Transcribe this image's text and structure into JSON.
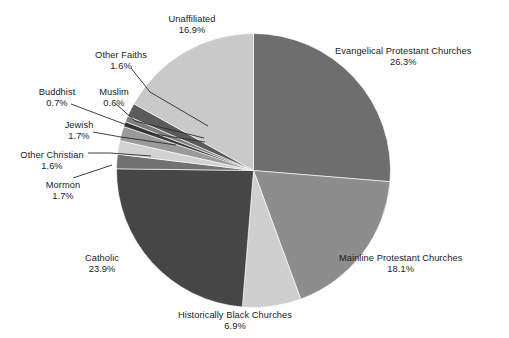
{
  "chart_data": {
    "type": "pie",
    "title": "",
    "subtitle": "",
    "xlabel": "",
    "ylabel": "",
    "grid": false,
    "legend_position": "none",
    "label_format": "name above percent, leader lines to thin slices",
    "start_angle_deg": 0,
    "direction": "clockwise",
    "units": "percent",
    "categories": [
      "Evangelical Protestant Churches",
      "Mainline Protestant Churches",
      "Historically Black Churches",
      "Catholic",
      "Mormon",
      "Other Christian",
      "Jewish",
      "Muslim",
      "Buddhist",
      "Other Faiths",
      "Unaffiliated"
    ],
    "values": [
      26.3,
      18.1,
      6.9,
      23.9,
      1.7,
      1.6,
      1.7,
      0.6,
      0.7,
      1.6,
      16.9
    ],
    "slices": [
      {
        "label": "Evangelical Protestant Churches",
        "percent": 26.3,
        "percent_text": "26.3%",
        "color": "#6e6e6e"
      },
      {
        "label": "Mainline Protestant Churches",
        "percent": 18.1,
        "percent_text": "18.1%",
        "color": "#8d8d8d"
      },
      {
        "label": "Historically Black Churches",
        "percent": 6.9,
        "percent_text": "6.9%",
        "color": "#cfcfcf"
      },
      {
        "label": "Catholic",
        "percent": 23.9,
        "percent_text": "23.9%",
        "color": "#464646"
      },
      {
        "label": "Mormon",
        "percent": 1.7,
        "percent_text": "1.7%",
        "color": "#717171"
      },
      {
        "label": "Other Christian",
        "percent": 1.6,
        "percent_text": "1.6%",
        "color": "#d2d2d2"
      },
      {
        "label": "Jewish",
        "percent": 1.7,
        "percent_text": "1.7%",
        "color": "#9a9a9a"
      },
      {
        "label": "Muslim",
        "percent": 0.6,
        "percent_text": "0.6%",
        "color": "#3a3a3a"
      },
      {
        "label": "Buddhist",
        "percent": 0.7,
        "percent_text": "0.7%",
        "color": "#7e7e7e"
      },
      {
        "label": "Other Faiths",
        "percent": 1.6,
        "percent_text": "1.6%",
        "color": "#5b5b5b"
      },
      {
        "label": "Unaffiliated",
        "percent": 16.9,
        "percent_text": "16.9%",
        "color": "#c9c9c9"
      }
    ]
  },
  "labels": {
    "evangelical": {
      "name": "Evangelical Protestant Churches",
      "percent": "26.3%"
    },
    "mainline": {
      "name": "Mainline Protestant Churches",
      "percent": "18.1%"
    },
    "historically": {
      "name": "Historically Black Churches",
      "percent": "6.9%"
    },
    "catholic": {
      "name": "Catholic",
      "percent": "23.9%"
    },
    "mormon": {
      "name": "Mormon",
      "percent": "1.7%"
    },
    "other_christian": {
      "name": "Other Christian",
      "percent": "1.6%"
    },
    "jewish": {
      "name": "Jewish",
      "percent": "1.7%"
    },
    "muslim": {
      "name": "Muslim",
      "percent": "0.6%"
    },
    "buddhist": {
      "name": "Buddhist",
      "percent": "0.7%"
    },
    "other_faiths": {
      "name": "Other Faiths",
      "percent": "1.6%"
    },
    "unaffiliated": {
      "name": "Unaffiliated",
      "percent": "16.9%"
    }
  },
  "style": {
    "background": "#ffffff",
    "text_color": "#1b1b1b",
    "leader_line_color": "#2b2b2b"
  }
}
